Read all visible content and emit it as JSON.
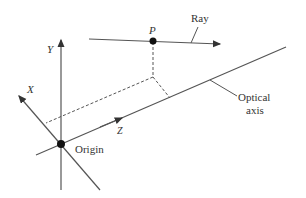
{
  "diagram": {
    "labels": {
      "y_axis": "Y",
      "x_axis": "X",
      "z_axis": "Z",
      "point": "P",
      "ray": "Ray",
      "origin": "Origin",
      "optical_line1": "Optical",
      "optical_line2": "axis"
    },
    "colors": {
      "line": "#444444",
      "text": "#333333",
      "background": "#ffffff"
    }
  }
}
